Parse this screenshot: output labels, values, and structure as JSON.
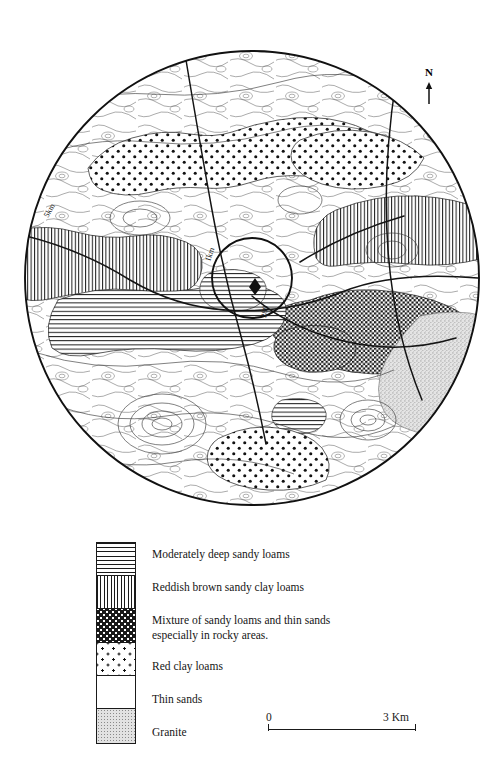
{
  "map": {
    "title": "Soil map of study area",
    "north_label": "N",
    "north_arrow_icon": "north-arrow-icon",
    "site_marker_icon": "site-marker-icon",
    "radius_labels": [
      {
        "text": "5km",
        "kind": "outer-radius"
      },
      {
        "text": "1km",
        "kind": "inner-radius"
      }
    ],
    "contour_labels": [
      "280"
    ],
    "regions": [
      {
        "name": "red-clay-loams-north",
        "pattern": "dots"
      },
      {
        "name": "reddish-brown-sandy-clay-loams-northeast",
        "pattern": "vertical-lines"
      },
      {
        "name": "reddish-brown-sandy-clay-loams-west",
        "pattern": "vertical-lines"
      },
      {
        "name": "mixture-sandy-loams-thin-sands-east",
        "pattern": "checker"
      },
      {
        "name": "granite-far-east",
        "pattern": "stipple"
      },
      {
        "name": "moderately-deep-sandy-loams-centre",
        "pattern": "horizontal-lines"
      },
      {
        "name": "red-clay-loams-south",
        "pattern": "dots"
      },
      {
        "name": "thin-sands-background",
        "pattern": "blank"
      }
    ]
  },
  "legend": {
    "items": [
      {
        "pattern": "horizontal-lines",
        "label": "Moderately deep sandy loams"
      },
      {
        "pattern": "vertical-lines",
        "label": "Reddish brown sandy clay loams"
      },
      {
        "pattern": "checker",
        "label": "Mixture of sandy loams and thin sands\nespecially in rocky areas."
      },
      {
        "pattern": "dots",
        "label": "Red clay loams"
      },
      {
        "pattern": "blank",
        "label": "Thin sands"
      },
      {
        "pattern": "stipple",
        "label": "Granite"
      }
    ]
  },
  "scale": {
    "min_label": "0",
    "max_label": "3 Km"
  },
  "colors": {
    "ink": "#1a1a1a",
    "paper": "#ffffff",
    "granite_fill": "#e2e2e2"
  }
}
